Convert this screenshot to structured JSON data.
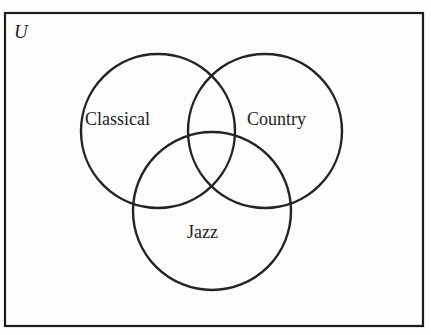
{
  "figure": {
    "type": "venn-diagram",
    "set_count": 3,
    "universe_label": "U",
    "background_color": "#fdfdfc",
    "stroke_color": "#1c1c1c",
    "fill": "none"
  },
  "universe": {
    "label": "U",
    "rect": {
      "x": 4,
      "y": 12,
      "width": 420,
      "height": 315
    },
    "border_width": 2
  },
  "sets": [
    {
      "label": "Classical",
      "name": "classical",
      "circle": {
        "cx": 158,
        "cy": 131,
        "r": 77
      },
      "label_pos": {
        "x": 85,
        "y": 110
      }
    },
    {
      "label": "Country",
      "name": "country",
      "circle": {
        "cx": 265,
        "cy": 131,
        "r": 77
      },
      "label_pos": {
        "x": 247,
        "y": 110
      }
    },
    {
      "label": "Jazz",
      "name": "jazz",
      "circle": {
        "cx": 212,
        "cy": 211,
        "r": 79
      },
      "label_pos": {
        "x": 187,
        "y": 223
      }
    }
  ],
  "chart_data": {
    "type": "venn",
    "title": "",
    "universe_label": "U",
    "set_labels": [
      "Classical",
      "Country",
      "Jazz"
    ],
    "regions": [
      "Classical only",
      "Country only",
      "Jazz only",
      "Classical ∩ Country",
      "Classical ∩ Jazz",
      "Country ∩ Jazz",
      "Classical ∩ Country ∩ Jazz",
      "outside all sets (within U)"
    ],
    "region_values": [],
    "legend": "none",
    "grid": false
  }
}
